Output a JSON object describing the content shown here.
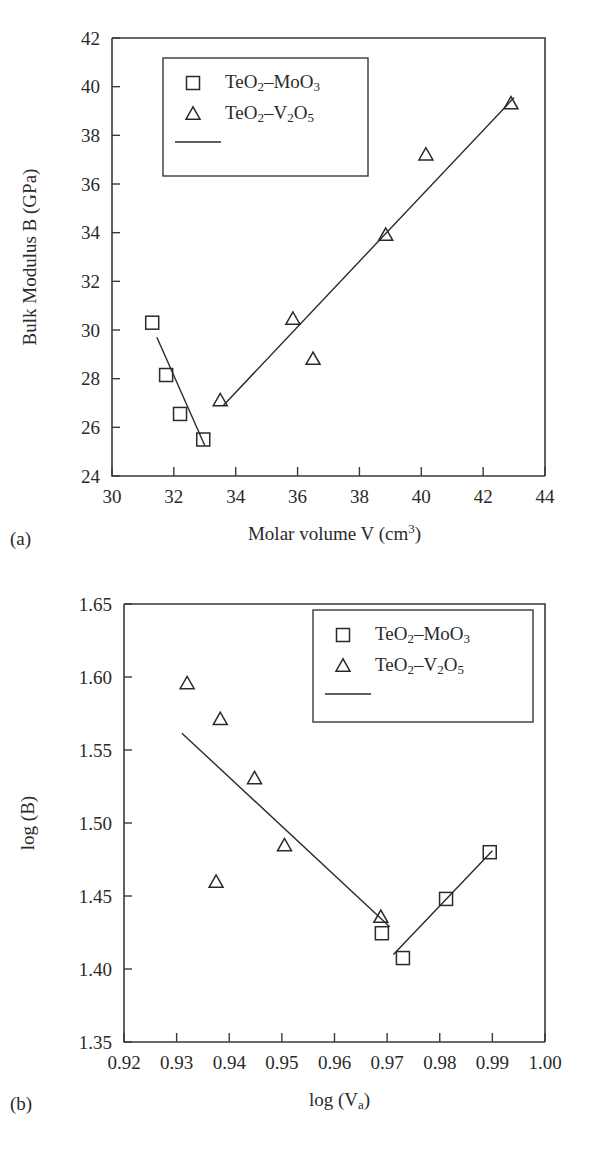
{
  "figure": {
    "panel_a_label": "(a)",
    "panel_b_label": "(b)"
  },
  "chart_data": [
    {
      "id": "panel-a",
      "type": "scatter",
      "title": "",
      "xlabel": "Molar volume V (cm3)",
      "xlabel_main": "Molar volume V (cm",
      "xlabel_sup": "3",
      "xlabel_tail": ")",
      "ylabel": "Bulk Modulus B (GPa)",
      "xlim": [
        30,
        44
      ],
      "ylim": [
        24,
        42
      ],
      "xticks": [
        "30",
        "32",
        "34",
        "36",
        "38",
        "40",
        "42",
        "44"
      ],
      "xtick_values": [
        30,
        32,
        34,
        36,
        38,
        40,
        42,
        44
      ],
      "yticks": [
        "24",
        "26",
        "28",
        "30",
        "32",
        "34",
        "36",
        "38",
        "40",
        "42"
      ],
      "ytick_values": [
        24,
        26,
        28,
        30,
        32,
        34,
        36,
        38,
        40,
        42
      ],
      "grid": false,
      "legend_position": "top-left",
      "legend": [
        {
          "marker": "square",
          "label": "TeO2-MoO3"
        },
        {
          "marker": "triangle",
          "label": "TeO2-V2O5"
        },
        {
          "marker": "line",
          "label": ""
        }
      ],
      "series": [
        {
          "name": "TeO2-MoO3",
          "marker": "square",
          "points": [
            {
              "x": 31.3,
              "y": 30.3
            },
            {
              "x": 31.75,
              "y": 28.15
            },
            {
              "x": 32.2,
              "y": 26.55
            },
            {
              "x": 32.95,
              "y": 25.5
            }
          ]
        },
        {
          "name": "TeO2-V2O5",
          "marker": "triangle",
          "points": [
            {
              "x": 33.5,
              "y": 27.1
            },
            {
              "x": 35.85,
              "y": 30.45
            },
            {
              "x": 36.5,
              "y": 28.8
            },
            {
              "x": 38.85,
              "y": 33.9
            },
            {
              "x": 40.15,
              "y": 37.2
            },
            {
              "x": 42.9,
              "y": 39.3
            }
          ]
        }
      ],
      "fit_lines": [
        {
          "name": "MoO3-fit",
          "x1": 31.45,
          "y1": 29.7,
          "x2": 33.0,
          "y2": 25.25
        },
        {
          "name": "V2O5-fit",
          "x1": 33.6,
          "y1": 26.9,
          "x2": 43.0,
          "y2": 39.55
        }
      ]
    },
    {
      "id": "panel-b",
      "type": "scatter",
      "title": "",
      "xlabel": "log (Va)",
      "xlabel_main": "log (V",
      "xlabel_sub": "a",
      "xlabel_tail": ")",
      "ylabel": "log (B)",
      "xlim": [
        0.92,
        1.0
      ],
      "ylim": [
        1.35,
        1.65
      ],
      "xticks": [
        "0.92",
        "0.93",
        "0.94",
        "0.95",
        "0.96",
        "0.97",
        "0.98",
        "0.99",
        "1.00"
      ],
      "xtick_values": [
        0.92,
        0.93,
        0.94,
        0.95,
        0.96,
        0.97,
        0.98,
        0.99,
        1.0
      ],
      "yticks": [
        "1.35",
        "1.40",
        "1.45",
        "1.50",
        "1.55",
        "1.60",
        "1.65"
      ],
      "ytick_values": [
        1.35,
        1.4,
        1.45,
        1.5,
        1.55,
        1.6,
        1.65
      ],
      "grid": false,
      "legend_position": "top-right",
      "legend": [
        {
          "marker": "square",
          "label": "TeO2-MoO3"
        },
        {
          "marker": "triangle",
          "label": "TeO2-V2O5"
        },
        {
          "marker": "line",
          "label": ""
        }
      ],
      "series": [
        {
          "name": "TeO2-MoO3",
          "marker": "square",
          "points": [
            {
              "x": 0.969,
              "y": 1.4245
            },
            {
              "x": 0.973,
              "y": 1.4075
            },
            {
              "x": 0.9812,
              "y": 1.448
            },
            {
              "x": 0.9895,
              "y": 1.48
            }
          ]
        },
        {
          "name": "TeO2-V2O5",
          "marker": "triangle",
          "points": [
            {
              "x": 0.932,
              "y": 1.5955
            },
            {
              "x": 0.9383,
              "y": 1.571
            },
            {
              "x": 0.9375,
              "y": 1.4595
            },
            {
              "x": 0.9448,
              "y": 1.5305
            },
            {
              "x": 0.9505,
              "y": 1.4845
            },
            {
              "x": 0.9688,
              "y": 1.4355
            }
          ]
        }
      ],
      "fit_lines": [
        {
          "name": "V2O5-fit",
          "x1": 0.931,
          "y1": 1.5615,
          "x2": 0.9705,
          "y2": 1.429
        },
        {
          "name": "MoO3-fit",
          "x1": 0.9712,
          "y1": 1.41,
          "x2": 0.99,
          "y2": 1.481
        }
      ]
    }
  ]
}
